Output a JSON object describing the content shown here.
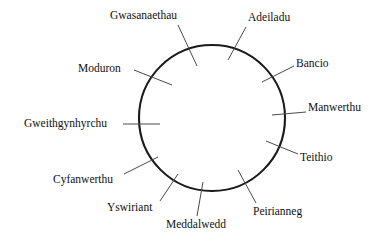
{
  "figure": {
    "type": "pie-chart",
    "background_color": "#ffffff",
    "outline_color": "#1a1a1a",
    "leader_color": "#4a4a4a",
    "center_x": 212,
    "center_y": 118,
    "radius": 73
  },
  "chart_data": {
    "type": "pie",
    "title": "",
    "subtitle": "",
    "xlabel": "",
    "ylabel": "",
    "legend_position": "none",
    "grid": false,
    "labels_shown": true,
    "value_labels_shown": false,
    "total_sectors": 11,
    "start_angle_deg": 90,
    "direction": "clockwise",
    "categories": [
      "Adeiladu",
      "Bancio",
      "Manwerthu",
      "Teithio",
      "Peirianneg",
      "Meddalwedd",
      "Yswiriant",
      "Cyfanwerthu",
      "Gweithgynhyrchu",
      "Moduron",
      "Gwasanaethau"
    ],
    "values": [
      11.5,
      11.0,
      12.0,
      11.5,
      11.0,
      3.5,
      6.5,
      8.0,
      9.0,
      10.0,
      6.0
    ],
    "sector_boundaries_deg": [
      90,
      48.6,
      9.0,
      -34.2,
      -75.6,
      -115.2,
      -127.8,
      -151.2,
      -180.0,
      -212.4,
      -248.4,
      -270.0
    ],
    "series": [
      {
        "name": "Cyfran",
        "values": [
          11.5,
          11.0,
          12.0,
          11.5,
          11.0,
          3.5,
          6.5,
          8.0,
          9.0,
          10.0,
          6.0
        ]
      }
    ]
  },
  "labels": [
    {
      "id": "gwasanaethau",
      "text": "Gwasanaethau",
      "x": 110,
      "y": 10,
      "leader": {
        "x1": 178,
        "y1": 25,
        "x2": 197,
        "y2": 66
      }
    },
    {
      "id": "adeiladu",
      "text": "Adeiladu",
      "x": 248,
      "y": 12,
      "leader": {
        "x1": 246,
        "y1": 27,
        "x2": 228,
        "y2": 60
      }
    },
    {
      "id": "bancio",
      "text": "Bancio",
      "x": 296,
      "y": 58,
      "leader": {
        "x1": 294,
        "y1": 66,
        "x2": 262,
        "y2": 82
      }
    },
    {
      "id": "manwerthu",
      "text": "Manwerthu",
      "x": 308,
      "y": 102,
      "leader": {
        "x1": 306,
        "y1": 112,
        "x2": 272,
        "y2": 115
      }
    },
    {
      "id": "teithio",
      "text": "Teithio",
      "x": 300,
      "y": 152,
      "leader": {
        "x1": 298,
        "y1": 154,
        "x2": 266,
        "y2": 141
      }
    },
    {
      "id": "peirianneg",
      "text": "Peirianneg",
      "x": 253,
      "y": 206,
      "leader": {
        "x1": 256,
        "y1": 203,
        "x2": 238,
        "y2": 170
      }
    },
    {
      "id": "meddalwedd",
      "text": "Meddalwedd",
      "x": 166,
      "y": 219,
      "leader": {
        "x1": 197,
        "y1": 216,
        "x2": 203,
        "y2": 182
      }
    },
    {
      "id": "yswiriant",
      "text": "Yswiriant",
      "x": 107,
      "y": 202,
      "leader": {
        "x1": 160,
        "y1": 201,
        "x2": 178,
        "y2": 174
      }
    },
    {
      "id": "cyfanwerthu",
      "text": "Cyfanwerthu",
      "x": 53,
      "y": 174,
      "leader": {
        "x1": 124,
        "y1": 174,
        "x2": 158,
        "y2": 157
      }
    },
    {
      "id": "gweithgynhyrchu",
      "text": "Gweithgynhyrchu",
      "x": 24,
      "y": 118,
      "leader": {
        "x1": 123,
        "y1": 124,
        "x2": 160,
        "y2": 124
      }
    },
    {
      "id": "moduron",
      "text": "Moduron",
      "x": 78,
      "y": 63,
      "leader": {
        "x1": 134,
        "y1": 70,
        "x2": 172,
        "y2": 85
      }
    }
  ]
}
